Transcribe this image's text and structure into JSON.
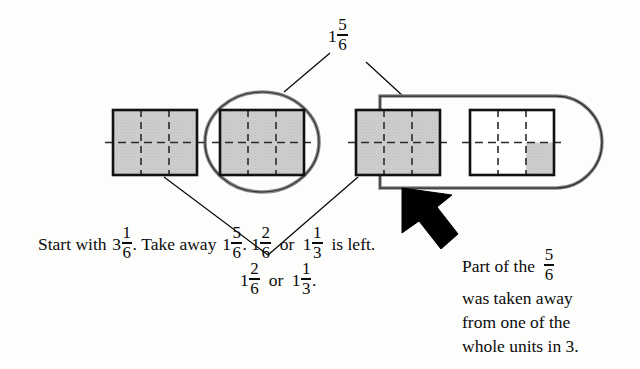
{
  "figure": {
    "title_label": "1 5/6",
    "type": "fraction-subtraction-area-model",
    "colors": {
      "ink": "#0b0b0b",
      "shade_fill": "#cccccc",
      "paper": "#fdfdfc",
      "arrow": "#000000"
    }
  },
  "top_label": {
    "whole": "1",
    "numerator": "5",
    "denominator": "6"
  },
  "model": {
    "unit_count": 4,
    "cells_per_unit": 6,
    "columns": 3,
    "rows": 2,
    "units": [
      {
        "name": "unit-1",
        "shaded_cells": 6,
        "fully_shaded": true,
        "partial_cells": []
      },
      {
        "name": "unit-2",
        "shaded_cells": 6,
        "fully_shaded": true,
        "partial_cells": []
      },
      {
        "name": "unit-3",
        "shaded_cells": 6,
        "fully_shaded": true,
        "partial_cells": []
      },
      {
        "name": "unit-4",
        "shaded_cells": 1,
        "fully_shaded": false,
        "partial_cells": [
          "bottom-right"
        ]
      }
    ]
  },
  "annotations": {
    "ellipse_group_label": "1 5/6",
    "stadium_group_label": "1 5/6",
    "arrow_direction": "up-left"
  },
  "text_start": {
    "line1": {
      "pre": "Start with",
      "whole": "3",
      "numerator": "1",
      "denominator": "6",
      "post": "."
    },
    "line2": {
      "pre": "Take away",
      "whole": "1",
      "numerator": "5",
      "denominator": "6",
      "post": "."
    },
    "line3": {
      "whole_a": "1",
      "num_a": "2",
      "den_a": "6",
      "conj": "or",
      "whole_b": "1",
      "num_b": "1",
      "den_b": "3",
      "post": "is left."
    }
  },
  "text_middle_label": {
    "whole_a": "1",
    "num_a": "2",
    "den_a": "6",
    "conj": "or",
    "whole_b": "1",
    "num_b": "1",
    "den_b": "3",
    "post": "."
  },
  "text_right": {
    "line1_pre": "Part of the",
    "line1_num": "5",
    "line1_den": "6",
    "line2": "was taken away",
    "line3": "from one of the",
    "line4": "whole units in 3."
  }
}
